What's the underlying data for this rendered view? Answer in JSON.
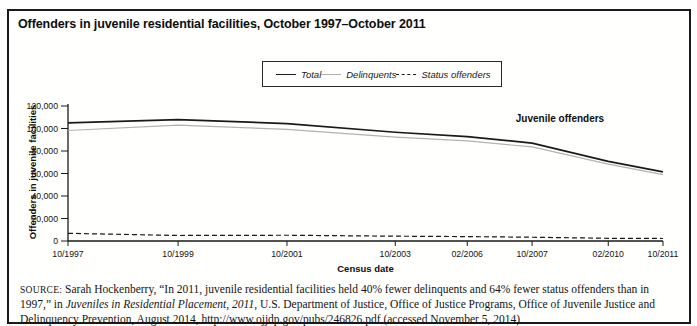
{
  "title": "Offenders in juvenile residential facilities, October 1997–October 2011",
  "legend": {
    "items": [
      {
        "label": "Total",
        "style": "solid",
        "color": "#1a1a1a"
      },
      {
        "label": "Delinquents",
        "style": "solid",
        "color": "#b2b2b2"
      },
      {
        "label": "Status offenders",
        "style": "dashed",
        "color": "#1a1a1a"
      }
    ]
  },
  "chart_data": {
    "type": "line",
    "title": "Offenders in juvenile residential facilities, October 1997–October 2011",
    "xlabel": "Census date",
    "ylabel": "Offenders in juvenile facilities",
    "annotation": "Juvenile offenders",
    "categories": [
      "10/1997",
      "10/1999",
      "10/2001",
      "10/2003",
      "02/2006",
      "10/2007",
      "02/2010",
      "10/2011"
    ],
    "x_fractions": [
      0,
      0.185,
      0.368,
      0.55,
      0.671,
      0.78,
      0.908,
      1
    ],
    "ylim": [
      0,
      120000
    ],
    "ytick_values": [
      0,
      20000,
      40000,
      60000,
      80000,
      100000,
      120000
    ],
    "ytick_labels": [
      "0",
      "20,000",
      "40,000",
      "60,000",
      "80,000",
      "100,000",
      "120,000"
    ],
    "grid": false,
    "legend_position": "top-center",
    "series": [
      {
        "name": "Total",
        "style": "solid",
        "color": "#1a1a1a",
        "width": 1.7,
        "values": [
          105055,
          107856,
          104413,
          96655,
          92854,
          86927,
          70793,
          61423
        ]
      },
      {
        "name": "Delinquents",
        "style": "solid",
        "color": "#b2b2b2",
        "width": 1.2,
        "values": [
          98222,
          102958,
          99297,
          92377,
          88931,
          83588,
          68383,
          58944
        ]
      },
      {
        "name": "Status offenders",
        "style": "dashed",
        "color": "#1a1a1a",
        "width": 1.2,
        "values": [
          6833,
          4898,
          5116,
          4278,
          3923,
          3339,
          2410,
          2239
        ]
      }
    ]
  },
  "source": {
    "label": "SOURCE:",
    "segments": [
      {
        "text": " Sarah Hockenberry, “In 2011, juvenile residential facilities held 40% fewer delinquents and 64% fewer status offenders than in 1997,” in ",
        "italic": false
      },
      {
        "text": "Juveniles in Residential Placement, 2011",
        "italic": true
      },
      {
        "text": ", U.S. Department of Justice, Office of Justice Programs, Office of Juvenile Justice and Delinquency Prevention, August 2014, http://www.ojjdp.gov/pubs/246826.pdf (accessed November 5, 2014)",
        "italic": false
      }
    ]
  }
}
